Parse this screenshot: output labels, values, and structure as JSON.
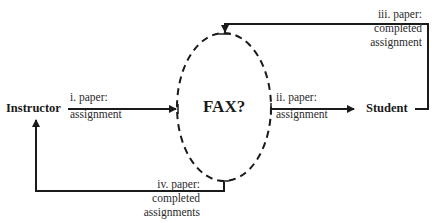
{
  "nodes": {
    "instructor": "Instructor",
    "student": "Student",
    "center": "FAX?"
  },
  "edges": [
    {
      "id": "i",
      "from": "Instructor",
      "to": "FAX?",
      "lines": [
        "i. paper:",
        "assignment"
      ]
    },
    {
      "id": "ii",
      "from": "FAX?",
      "to": "Student",
      "lines": [
        "ii. paper:",
        "assignment"
      ]
    },
    {
      "id": "iii",
      "from": "Student",
      "to": "FAX?",
      "lines": [
        "iii. paper:",
        "completed",
        "assignment"
      ]
    },
    {
      "id": "iv",
      "from": "FAX?",
      "to": "Instructor",
      "lines": [
        "iv. paper:",
        "completed",
        "assignments"
      ]
    }
  ],
  "colors": {
    "line": "#1a1a1a",
    "text": "#2a2a2a",
    "background": "#ffffff"
  }
}
